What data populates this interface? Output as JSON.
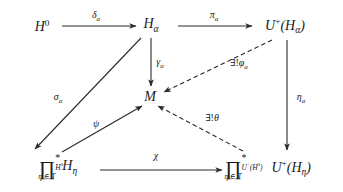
{
  "diagram": {
    "type": "commutative-diagram",
    "canvas": {
      "width": 343,
      "height": 192,
      "background": "#ffffff"
    },
    "ink_color": "#2a2a2a",
    "nodes": [
      {
        "id": "H0",
        "label": "H⁰",
        "x": 42,
        "y": 26
      },
      {
        "id": "Halpha",
        "label": "Hₐ",
        "x": 151,
        "y": 26
      },
      {
        "id": "UHalpha",
        "label": "U⁺(Hₐ)",
        "x": 285,
        "y": 26
      },
      {
        "id": "M",
        "label": "M",
        "x": 150,
        "y": 97
      },
      {
        "id": "prodLeft",
        "label": "∏* over H⁰, η∈T, of Hη",
        "x": 58,
        "y": 168
      },
      {
        "id": "prodRight",
        "label": "∏* over U⁺(H⁰), η∈T, of U⁺(Hη)",
        "x": 268,
        "y": 168
      }
    ],
    "edges": [
      {
        "id": "delta",
        "label": "δₐ",
        "from": "H0",
        "to": "Halpha",
        "style": "solid",
        "label_x": 96,
        "label_y": 16
      },
      {
        "id": "pi",
        "label": "πₐ",
        "from": "Halpha",
        "to": "UHalpha",
        "style": "solid",
        "label_x": 214,
        "label_y": 16
      },
      {
        "id": "gamma",
        "label": "γₐ",
        "from": "Halpha",
        "to": "M",
        "style": "solid",
        "label_x": 159,
        "label_y": 63
      },
      {
        "id": "phi",
        "label": "∃!φₐ",
        "from": "UHalpha",
        "to": "M",
        "style": "dashed",
        "label_x": 238,
        "label_y": 64
      },
      {
        "id": "eta",
        "label": "ηₐ",
        "from": "UHalpha",
        "to": "prodRight",
        "style": "solid",
        "label_x": 300,
        "label_y": 98
      },
      {
        "id": "sigma",
        "label": "σₐ",
        "from": "Halpha",
        "to": "prodLeft",
        "style": "solid",
        "label_x": 58,
        "label_y": 98
      },
      {
        "id": "psi",
        "label": "ψ",
        "from": "prodLeft",
        "to": "M",
        "style": "solid",
        "label_x": 96,
        "label_y": 123
      },
      {
        "id": "theta",
        "label": "∃!θ",
        "from": "prodRight",
        "to": "M",
        "style": "dashed",
        "label_x": 212,
        "label_y": 118
      },
      {
        "id": "chi",
        "label": "χ",
        "from": "prodLeft",
        "to": "prodRight",
        "style": "solid",
        "label_x": 156,
        "label_y": 156
      }
    ],
    "symbols": {
      "product": "∏",
      "star": "*",
      "index_sub": "η ∈ T",
      "H0": "H⁰",
      "UH0": "U⁺(H⁰)",
      "H_eta": "Hη",
      "UH_eta": "U⁺(Hη)",
      "exists_unique": "∃!"
    }
  }
}
